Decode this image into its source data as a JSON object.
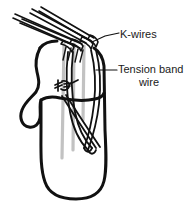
{
  "figure": {
    "type": "medical-line-illustration",
    "background_color": "#ffffff",
    "ink_color": "#111111",
    "shadow_color": "#bdbdbd",
    "labels": {
      "kwires": "K-wires",
      "tension_band_line1": "Tension band",
      "tension_band_line2": "wire"
    },
    "annotations": {
      "kwire_count": 4,
      "leader_kwires": "diagonal leader from wire bundle to K-wires label",
      "leader_tension": "horizontal leader from wire loop to Tension band wire label",
      "knot": "twisted wire knot on bone surface"
    }
  }
}
